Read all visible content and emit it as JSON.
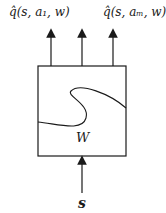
{
  "diagram": {
    "outputs": [
      {
        "label": "q̂(s, a₁, w)"
      },
      {
        "label": ""
      },
      {
        "label": "q̂(s, aₘ, w)"
      }
    ],
    "box_label": "W",
    "input_label": "s",
    "colors": {
      "stroke": "#1a1a1a",
      "background": "#ffffff"
    }
  }
}
